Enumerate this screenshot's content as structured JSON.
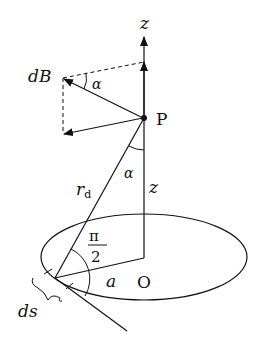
{
  "diagram": {
    "labels": {
      "z_axis": "z",
      "dB": "dB",
      "alpha_top": "α",
      "point": "P",
      "alpha_mid": "α",
      "r_d": "r",
      "r_d_sub": "d",
      "z_dist": "z",
      "pi": "π",
      "two": "2",
      "radius": "a",
      "origin": "O",
      "ds": "ds"
    },
    "colors": {
      "stroke": "#111111",
      "background": "#ffffff"
    }
  }
}
